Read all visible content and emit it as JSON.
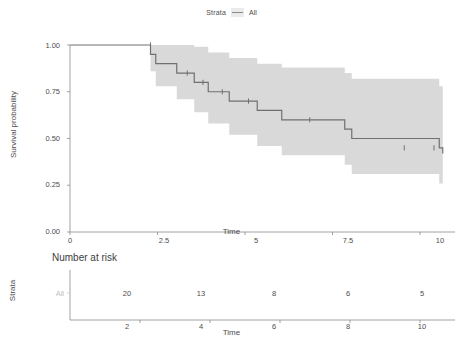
{
  "legend": {
    "title": "Strata",
    "label": "All",
    "key_icon": "line-swatch-icon",
    "line_color": "#8a8a8a",
    "key_bg": "#ebebeb"
  },
  "main_plot": {
    "y_axis_title": "Survival probability",
    "x_axis_title": "Time",
    "y_ticks": [
      "1.00",
      "0.75",
      "0.50",
      "0.25",
      "0.00"
    ],
    "x_ticks": [
      "0",
      "2.5",
      "5",
      "7.5",
      "10"
    ],
    "curve_color": "#707070",
    "band_color": "#d9d9d9"
  },
  "risk_table": {
    "title": "Number at risk",
    "strata_axis_title": "Strata",
    "row_label": "All",
    "x_axis_title": "Time",
    "x_ticks": [
      "2",
      "4",
      "6",
      "8",
      "10"
    ],
    "counts": [
      "20",
      "13",
      "8",
      "6",
      "5"
    ]
  },
  "chart_data": {
    "type": "line",
    "title": "",
    "xlabel": "Time",
    "ylabel": "Survival probability",
    "xlim": [
      0,
      11
    ],
    "ylim": [
      0,
      1
    ],
    "grid": false,
    "legend_position": "top-center",
    "series": [
      {
        "name": "All",
        "type": "kaplan-meier-step",
        "color": "#707070",
        "time": [
          0,
          2.3,
          2.45,
          3.05,
          3.55,
          3.95,
          4.55,
          5.35,
          6.05,
          7.85,
          8.05,
          10.55,
          10.65
        ],
        "survival": [
          1.0,
          0.95,
          0.9,
          0.85,
          0.8,
          0.75,
          0.7,
          0.65,
          0.6,
          0.55,
          0.5,
          0.45,
          0.42
        ],
        "censor_times": [
          2.3,
          3.35,
          3.8,
          4.35,
          5.1,
          6.85,
          9.55,
          10.4
        ],
        "censor_survival": [
          1.0,
          0.85,
          0.8,
          0.75,
          0.7,
          0.6,
          0.45,
          0.45
        ]
      }
    ],
    "confidence_band": {
      "name": "95% CI",
      "color": "#d9d9d9",
      "time": [
        2.3,
        2.45,
        3.05,
        3.55,
        3.95,
        4.55,
        5.35,
        6.05,
        7.85,
        8.05,
        10.55,
        10.65
      ],
      "upper": [
        1.0,
        1.0,
        1.0,
        0.99,
        0.96,
        0.93,
        0.9,
        0.88,
        0.85,
        0.82,
        0.78,
        0.77
      ],
      "lower": [
        0.86,
        0.78,
        0.71,
        0.64,
        0.58,
        0.52,
        0.46,
        0.41,
        0.36,
        0.31,
        0.26,
        0.16
      ]
    },
    "risk_table": {
      "strata": "All",
      "times": [
        2,
        4,
        6,
        8,
        10
      ],
      "counts": [
        20,
        13,
        8,
        6,
        5
      ]
    }
  }
}
